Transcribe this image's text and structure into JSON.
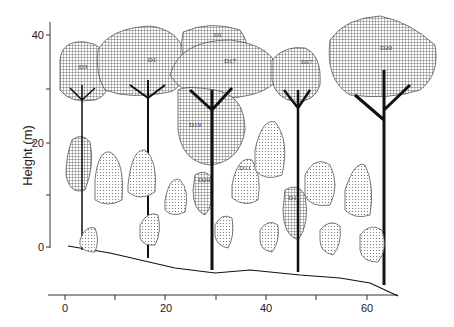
{
  "figure": {
    "title": "",
    "y_axis": {
      "label": "Height (m)",
      "ticks": [
        "0",
        "20",
        "40"
      ],
      "minor_ticks": [
        10,
        30
      ],
      "range": [
        0,
        40
      ]
    },
    "x_axis": {
      "label": "",
      "ticks": [
        "0",
        "20",
        "40",
        "60"
      ],
      "minor_ticks": [
        10,
        30,
        50
      ],
      "range": [
        0,
        65
      ]
    },
    "tree_labels": [
      "D3",
      "D1",
      "D1",
      "D17",
      "D19",
      "D20",
      "D11",
      "D11",
      "D17",
      "D20"
    ],
    "crown_patterns": {
      "emergent": "cross-hatch",
      "understory": "stipple"
    }
  }
}
